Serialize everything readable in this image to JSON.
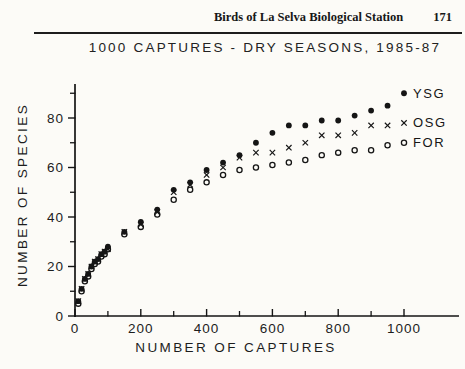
{
  "page": {
    "running_title": "Birds of La Selva Biological Station",
    "page_number": "171"
  },
  "chart_data": {
    "type": "scatter",
    "title": "1000 CAPTURES - DRY SEASONS, 1985-87",
    "xlabel": "NUMBER OF CAPTURES",
    "ylabel": "NUMBER OF SPECIES",
    "xlim": [
      0,
      1167
    ],
    "ylim": [
      0,
      93
    ],
    "grid": false,
    "legend_position": "end-of-series",
    "marker_color": "#151515",
    "x_ticks_major": [
      0,
      200,
      400,
      600,
      800,
      1000
    ],
    "x_ticks_minor": [
      100,
      300,
      500,
      700,
      900
    ],
    "y_ticks_major": [
      0,
      20,
      40,
      60,
      80
    ],
    "y_ticks_minor": [
      10,
      30,
      50,
      70,
      90
    ],
    "x": [
      10,
      20,
      30,
      40,
      50,
      60,
      70,
      80,
      90,
      100,
      150,
      200,
      250,
      300,
      350,
      400,
      450,
      500,
      550,
      600,
      650,
      700,
      750,
      800,
      850,
      900,
      950,
      1000
    ],
    "series": [
      {
        "name": "FOR",
        "marker": "open-circle",
        "values": [
          5,
          10,
          14,
          16,
          19,
          21,
          22,
          24,
          25,
          27,
          33,
          36,
          41,
          47,
          51,
          54,
          57,
          59,
          60,
          61,
          62,
          63,
          65,
          66,
          67,
          67,
          69,
          70
        ]
      },
      {
        "name": "OSG",
        "marker": "x-cross",
        "values": [
          6,
          11,
          15,
          17,
          20,
          22,
          23,
          25,
          26,
          27,
          34,
          37,
          42,
          50,
          53,
          57,
          60,
          64,
          66,
          66,
          68,
          70,
          73,
          73,
          74,
          77,
          77,
          78
        ]
      },
      {
        "name": "YSG",
        "marker": "filled-circle",
        "values": [
          6,
          11,
          15,
          17,
          20,
          22,
          23,
          25,
          26,
          28,
          34,
          38,
          43,
          51,
          54,
          59,
          62,
          65,
          70,
          74,
          77,
          77,
          79,
          79,
          81,
          83,
          85,
          90
        ]
      }
    ],
    "series_label_order": [
      "YSG",
      "OSG",
      "FOR"
    ]
  }
}
